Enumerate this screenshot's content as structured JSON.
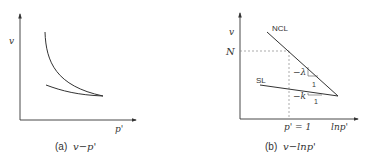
{
  "panel_a": {
    "y_label": "v",
    "x_label": "p'",
    "caption_prefix": "(a)",
    "caption_math": "v−p'",
    "curves": [
      "upper-curve",
      "lower-curve"
    ]
  },
  "panel_b": {
    "y_label": "v",
    "x_label": "lnp'",
    "n_label": "N",
    "ncl_label": "NCL",
    "sl_label": "SL",
    "lambda_slope": "−λ",
    "lambda_run": "1",
    "k_slope": "−k",
    "k_run": "1",
    "p_one_label": "p' = 1",
    "caption_prefix": "(b)",
    "caption_math": "v−lnp'"
  },
  "colors": {
    "line": "#333333",
    "dashed": "#888888"
  }
}
